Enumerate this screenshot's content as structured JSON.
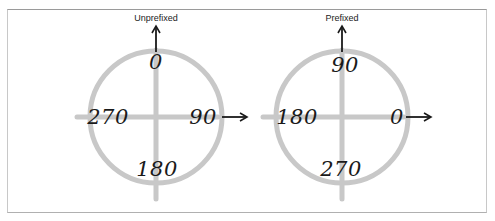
{
  "colors": {
    "ring": "#c8c8c8",
    "axis": "#c8c8c8",
    "arrow": "#1a1a1a",
    "text": "#1a1a1a",
    "frame": "#a0a0a0"
  },
  "diagrams": [
    {
      "title": "Unprefixed",
      "labels": {
        "top": "0",
        "right": "90",
        "bottom": "180",
        "left": "270"
      }
    },
    {
      "title": "Prefixed",
      "labels": {
        "top": "90",
        "right": "0",
        "bottom": "270",
        "left": "180"
      }
    }
  ]
}
